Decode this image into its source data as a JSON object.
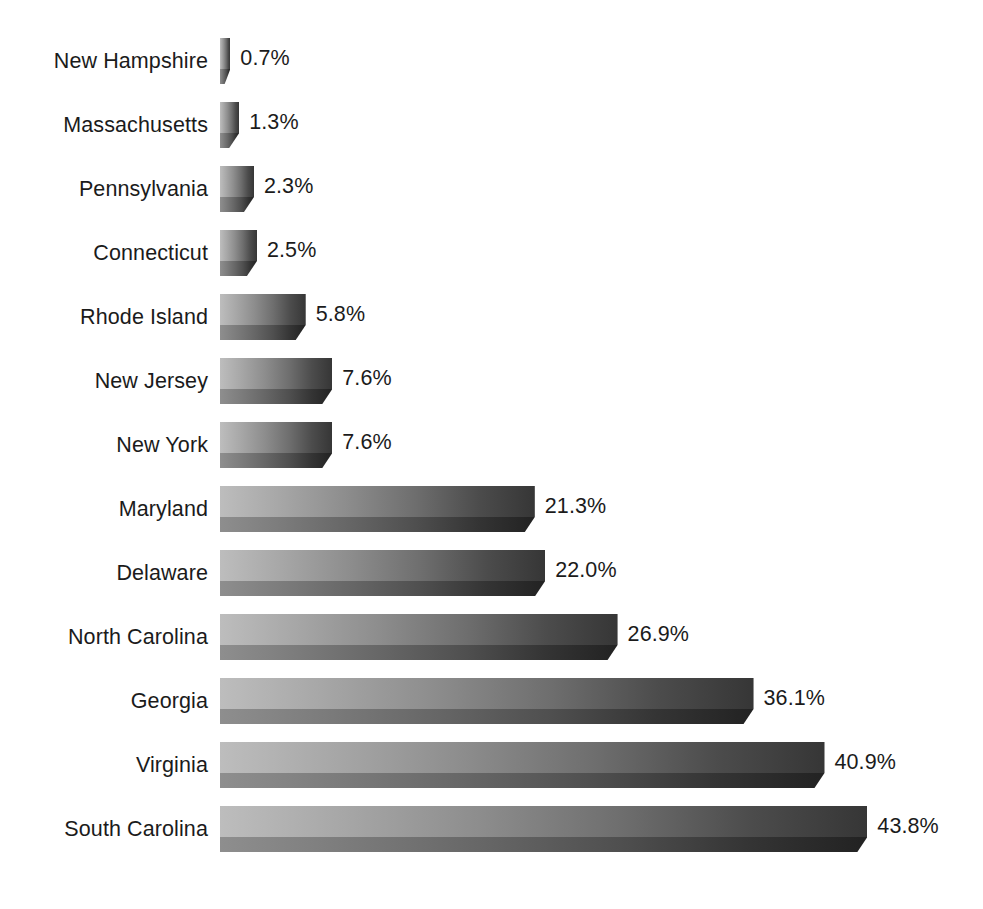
{
  "chart_data": {
    "type": "bar",
    "orientation": "horizontal",
    "title": "",
    "subtitle": "",
    "xlabel": "",
    "ylabel": "",
    "categories": [
      "New Hampshire",
      "Massachusetts",
      "Pennsylvania",
      "Connecticut",
      "Rhode Island",
      "New Jersey",
      "New York",
      "Maryland",
      "Delaware",
      "North Carolina",
      "Georgia",
      "Virginia",
      "South Carolina"
    ],
    "values": [
      0.7,
      1.3,
      2.3,
      2.5,
      5.8,
      7.6,
      7.6,
      21.3,
      22.0,
      26.9,
      36.1,
      40.9,
      43.8
    ],
    "value_labels": [
      "0.7%",
      "1.3%",
      "2.3%",
      "2.5%",
      "5.8%",
      "7.6%",
      "7.6%",
      "21.3%",
      "22.0%",
      "26.9%",
      "36.1%",
      "40.9%",
      "43.8%"
    ],
    "unit": "%",
    "xlim": [
      0,
      43.8
    ],
    "ylim": null,
    "grid": false,
    "legend": null,
    "axis_visible": false,
    "tick_labels_x": [],
    "tick_labels_y": [
      "New Hampshire",
      "Massachusetts",
      "Pennsylvania",
      "Connecticut",
      "Rhode Island",
      "New Jersey",
      "New York",
      "Maryland",
      "Delaware",
      "North Carolina",
      "Georgia",
      "Virginia",
      "South Carolina"
    ],
    "annotations": [],
    "colors": {
      "background": "#ffffff",
      "bar_gradient_start": "#bdbdbd",
      "bar_gradient_end": "#363636",
      "bar_shade_start": "#8e8e8e",
      "bar_shade_end": "#222222",
      "text": "#1b1b1b"
    }
  },
  "layout": {
    "bar_origin_x": 220,
    "px_per_unit": 14.78,
    "row_pitch": 64,
    "first_row_top": 38,
    "label_gap": 10,
    "bevel": 10
  }
}
